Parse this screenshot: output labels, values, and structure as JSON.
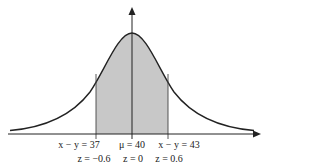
{
  "diagram": {
    "type": "normal-distribution",
    "mean_label": "μ = 40",
    "left_x_label": "x − y = 37",
    "right_x_label": "x − y = 43",
    "z_left": "z = −0.6",
    "z_center": "z = 0",
    "z_right": "z = 0.6",
    "shade_color": "#c8c8c8",
    "line_color": "#222222"
  }
}
